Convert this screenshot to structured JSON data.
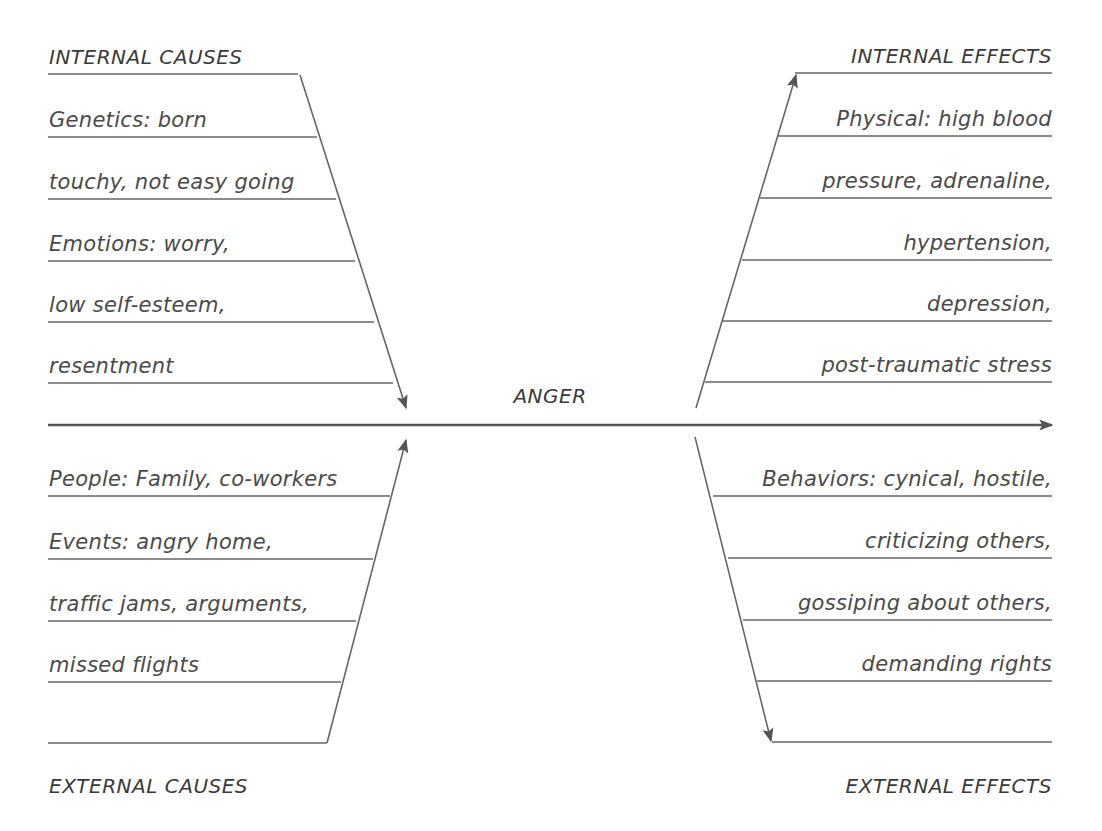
{
  "diagram": {
    "type": "fishbone",
    "center_label": "ANGER",
    "line_color": "#555555",
    "text_color": "#4a4a4a",
    "internal_causes": {
      "header": "INTERNAL CAUSES",
      "lines": [
        "Genetics: born",
        "touchy, not easy going",
        "Emotions: worry,",
        "low self-esteem,",
        "resentment"
      ]
    },
    "external_causes": {
      "header": "EXTERNAL CAUSES",
      "lines": [
        "People: Family, co-workers",
        "Events: angry home,",
        "traffic jams, arguments,",
        "missed flights"
      ]
    },
    "internal_effects": {
      "header": "INTERNAL EFFECTS",
      "lines": [
        "Physical: high blood",
        "pressure, adrenaline,",
        "hypertension,",
        "depression,",
        "post-traumatic stress"
      ]
    },
    "external_effects": {
      "header": "EXTERNAL EFFECTS",
      "lines": [
        "Behaviors: cynical, hostile,",
        "criticizing others,",
        "gossiping about others,",
        "demanding rights"
      ]
    }
  }
}
